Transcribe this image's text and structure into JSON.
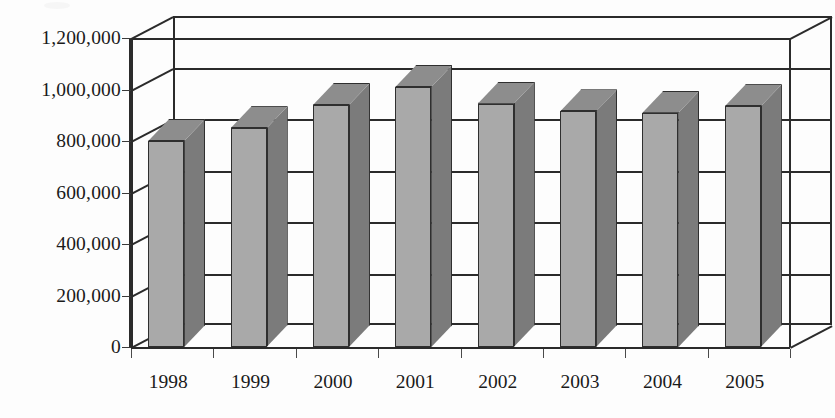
{
  "chart_data": {
    "type": "bar",
    "title": "",
    "subtitle": "",
    "xlabel": "",
    "ylabel": "",
    "categories": [
      "1998",
      "1999",
      "2000",
      "2001",
      "2002",
      "2003",
      "2004",
      "2005"
    ],
    "values": [
      800000,
      850000,
      940000,
      1010000,
      945000,
      915000,
      910000,
      935000
    ],
    "series": [
      {
        "name": "",
        "values": [
          800000,
          850000,
          940000,
          1010000,
          945000,
          915000,
          910000,
          935000
        ]
      }
    ],
    "ylim": [
      0,
      1200000
    ],
    "y_ticks": [
      0,
      200000,
      400000,
      600000,
      800000,
      1000000,
      1200000
    ],
    "y_tick_labels": [
      "0",
      "200,000",
      "400,000",
      "600,000",
      "800,000",
      "1,000,000",
      "1,200,000"
    ],
    "x_tick_labels": [
      "1998",
      "1999",
      "2000",
      "2001",
      "2002",
      "2003",
      "2004",
      "2005"
    ],
    "grid": true,
    "grid_orientation": "horizontal",
    "legend": false,
    "legend_position": "none",
    "three_d": true,
    "annotations": [],
    "colors": {
      "bar_front": "#a9a9a9",
      "bar_side": "#7b7b7b",
      "bar_top": "#8d8d8d",
      "outline": "#2f2f2f",
      "gridline": "#2b2b2b",
      "plot_background": "#fdfdfd",
      "text": "#1a1a1a"
    }
  }
}
